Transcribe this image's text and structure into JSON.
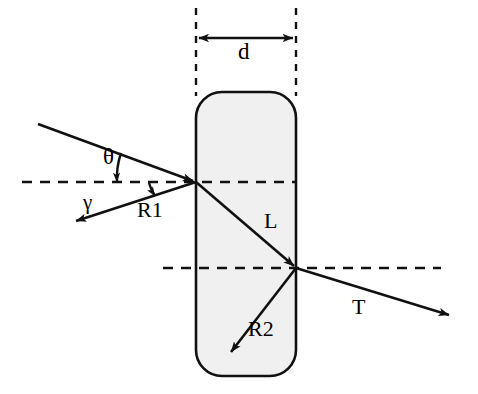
{
  "figure": {
    "width": 478,
    "height": 394,
    "background_color": "#ffffff",
    "stroke_color": "#000000",
    "slab_fill_color": "#f0f0f0"
  },
  "labels": {
    "thickness": "d",
    "incidence_angle": "θ",
    "reflection_angle": "γ",
    "first_reflection": "R1",
    "internal_path": "L",
    "second_reflection": "R2",
    "transmitted": "T"
  },
  "geometry": {
    "slab": {
      "left_x": 196,
      "right_x": 296,
      "top_y": 92,
      "bottom_y": 376,
      "corner_radius": 26
    },
    "dimension_arrow": {
      "y": 38,
      "from_x": 197,
      "to_x": 295
    },
    "vertical_dashed_lines": [
      {
        "x": 196,
        "from_y": 8,
        "to_y": 96
      },
      {
        "x": 296,
        "from_y": 8,
        "to_y": 96
      }
    ],
    "horizontal_dashed_normals": [
      {
        "y": 182,
        "from_x": 22,
        "to_x": 296
      },
      {
        "y": 268,
        "from_x": 163,
        "to_x": 441
      }
    ],
    "incidence_point": {
      "x": 196,
      "y": 182
    },
    "exit_point": {
      "x": 296,
      "y": 268
    },
    "rays": [
      {
        "name": "incident",
        "from_x": 38,
        "from_y": 124,
        "to_x": 196,
        "to_y": 182
      },
      {
        "name": "first-reflection",
        "from_x": 196,
        "from_y": 182,
        "to_x": 73,
        "to_y": 222
      },
      {
        "name": "internal-L",
        "from_x": 196,
        "from_y": 182,
        "to_x": 296,
        "to_y": 268
      },
      {
        "name": "internal-R2",
        "from_x": 296,
        "from_y": 268,
        "to_x": 228,
        "to_y": 355
      },
      {
        "name": "transmitted-T",
        "from_x": 296,
        "from_y": 268,
        "to_x": 452,
        "to_y": 316
      }
    ],
    "angle_arcs": [
      {
        "name": "theta",
        "cx": 196,
        "cy": 182,
        "radius": 78
      },
      {
        "name": "gamma",
        "cx": 196,
        "cy": 182,
        "radius": 48
      }
    ]
  }
}
